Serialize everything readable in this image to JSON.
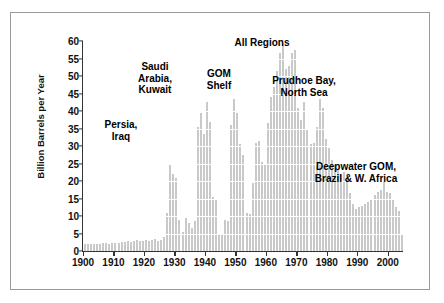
{
  "chart_data": {
    "type": "bar",
    "title": "",
    "xlabel": "",
    "ylabel": "Billion Barrels per Year",
    "xlim": [
      1900,
      2005
    ],
    "ylim": [
      0,
      60
    ],
    "grid": true,
    "legend_position": "none",
    "bar_color": "#c9c9c9",
    "y_ticks": [
      0,
      5,
      10,
      15,
      20,
      25,
      30,
      35,
      40,
      45,
      50,
      55,
      60
    ],
    "x_ticks": [
      1900,
      1910,
      1920,
      1930,
      1940,
      1950,
      1960,
      1970,
      1980,
      1990,
      2000
    ],
    "x": [
      1900,
      1901,
      1902,
      1903,
      1904,
      1905,
      1906,
      1907,
      1908,
      1909,
      1910,
      1911,
      1912,
      1913,
      1914,
      1915,
      1916,
      1917,
      1918,
      1919,
      1920,
      1921,
      1922,
      1923,
      1924,
      1925,
      1926,
      1927,
      1928,
      1929,
      1930,
      1931,
      1932,
      1933,
      1934,
      1935,
      1936,
      1937,
      1938,
      1939,
      1940,
      1941,
      1942,
      1943,
      1944,
      1945,
      1946,
      1947,
      1948,
      1949,
      1950,
      1951,
      1952,
      1953,
      1954,
      1955,
      1956,
      1957,
      1958,
      1959,
      1960,
      1961,
      1962,
      1963,
      1964,
      1965,
      1966,
      1967,
      1968,
      1969,
      1970,
      1971,
      1972,
      1973,
      1974,
      1975,
      1976,
      1977,
      1978,
      1979,
      1980,
      1981,
      1982,
      1983,
      1984,
      1985,
      1986,
      1987,
      1988,
      1989,
      1990,
      1991,
      1992,
      1993,
      1994,
      1995,
      1996,
      1997,
      1998,
      1999,
      2000,
      2001,
      2002,
      2003,
      2004
    ],
    "values": [
      2.0,
      2.0,
      2.1,
      2.1,
      2.0,
      2.1,
      2.2,
      2.2,
      2.1,
      2.2,
      2.3,
      2.4,
      2.5,
      2.6,
      2.8,
      2.7,
      3.0,
      3.1,
      2.9,
      3.0,
      3.2,
      3.0,
      3.2,
      3.4,
      2.9,
      3.1,
      4.0,
      11.0,
      24.5,
      22.0,
      21.0,
      9.0,
      5.5,
      9.5,
      8.0,
      6.5,
      8.5,
      35.5,
      39.5,
      33.5,
      42.5,
      37.0,
      15.5,
      15.0,
      5.0,
      4.5,
      9.0,
      8.5,
      36.0,
      43.5,
      39.5,
      30.5,
      27.5,
      11.0,
      10.5,
      19.5,
      31.0,
      31.5,
      25.5,
      25.0,
      36.5,
      44.0,
      47.0,
      51.5,
      56.5,
      59.5,
      52.0,
      53.0,
      56.5,
      57.5,
      41.0,
      37.5,
      42.5,
      35.0,
      30.5,
      31.0,
      35.5,
      43.5,
      41.0,
      32.0,
      29.5,
      26.0,
      24.5,
      23.5,
      22.0,
      22.5,
      21.0,
      16.5,
      13.5,
      12.0,
      12.5,
      13.0,
      13.5,
      14.0,
      15.0,
      16.0,
      17.0,
      17.5,
      20.0,
      17.0,
      16.5,
      14.5,
      12.5,
      11.5,
      5.0
    ],
    "annotations": [
      {
        "id": "all-regions",
        "text": "All Regions",
        "align": "center"
      },
      {
        "id": "saudi-kuwait",
        "text": "Saudi\nArabia,\nKuwait",
        "align": "center"
      },
      {
        "id": "gom-shelf",
        "text": "GOM\nShelf",
        "align": "center"
      },
      {
        "id": "prudhoe",
        "text": "Prudhoe Bay,\nNorth Sea",
        "align": "center"
      },
      {
        "id": "persia-iraq",
        "text": "Persia,\nIraq",
        "align": "center"
      },
      {
        "id": "deepwater",
        "text": "Deepwater GOM,\nBrazil & W. Africa",
        "align": "center"
      }
    ]
  }
}
